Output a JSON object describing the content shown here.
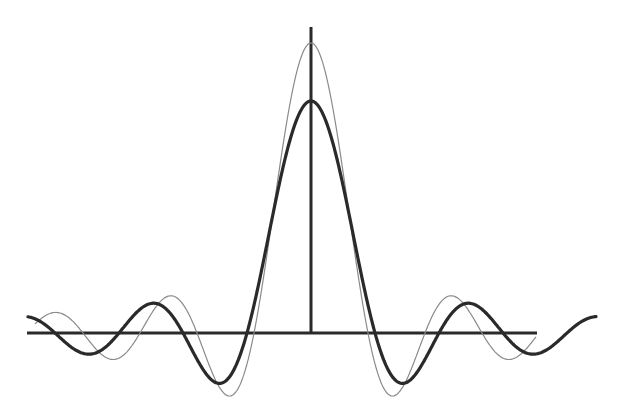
{
  "diagram": {
    "type": "function-plot",
    "colors": {
      "background": "#ffffff",
      "axis": "#2a2a2a",
      "thin_curve": "#8a8a8a",
      "thick_curve": "#2a2a2a"
    },
    "axes": {
      "origin_px": [
        311,
        333
      ],
      "x_axis_px": [
        27,
        537
      ],
      "y_axis_px": [
        27,
        333
      ],
      "stroke_width": 3
    },
    "curves": [
      {
        "name": "thin-sinc",
        "peak_px": 290,
        "first_zero_px": 57,
        "x_range_px": [
          35,
          536
        ],
        "stroke_width": 1.2,
        "damping": 0
      },
      {
        "name": "thick-smoothed-sinc",
        "peak_px": 232,
        "first_zero_px": 64,
        "x_range_px": [
          28,
          596
        ],
        "stroke_width": 3.2,
        "damping": 0
      }
    ],
    "measured_points": {
      "thin": {
        "peak": [
          311,
          43
        ],
        "min_inner_left": [
          229,
          396
        ],
        "min_inner_right": [
          392,
          396
        ],
        "lobe_left": [
          170,
          296
        ],
        "lobe_right": [
          451,
          296
        ],
        "min_outer_left": [
          113,
          359
        ],
        "min_outer_right": [
          510,
          359
        ]
      },
      "thick": {
        "peak": [
          311,
          101
        ],
        "min_inner_left": [
          226,
          363
        ],
        "min_inner_right": [
          397,
          364
        ],
        "lobe_left": [
          170,
          309
        ],
        "lobe_right": [
          451,
          309
        ],
        "min_outer_left": [
          112,
          348
        ],
        "min_outer_right": [
          510,
          348
        ],
        "lobe_far_right": [
          565,
          320
        ]
      }
    }
  }
}
